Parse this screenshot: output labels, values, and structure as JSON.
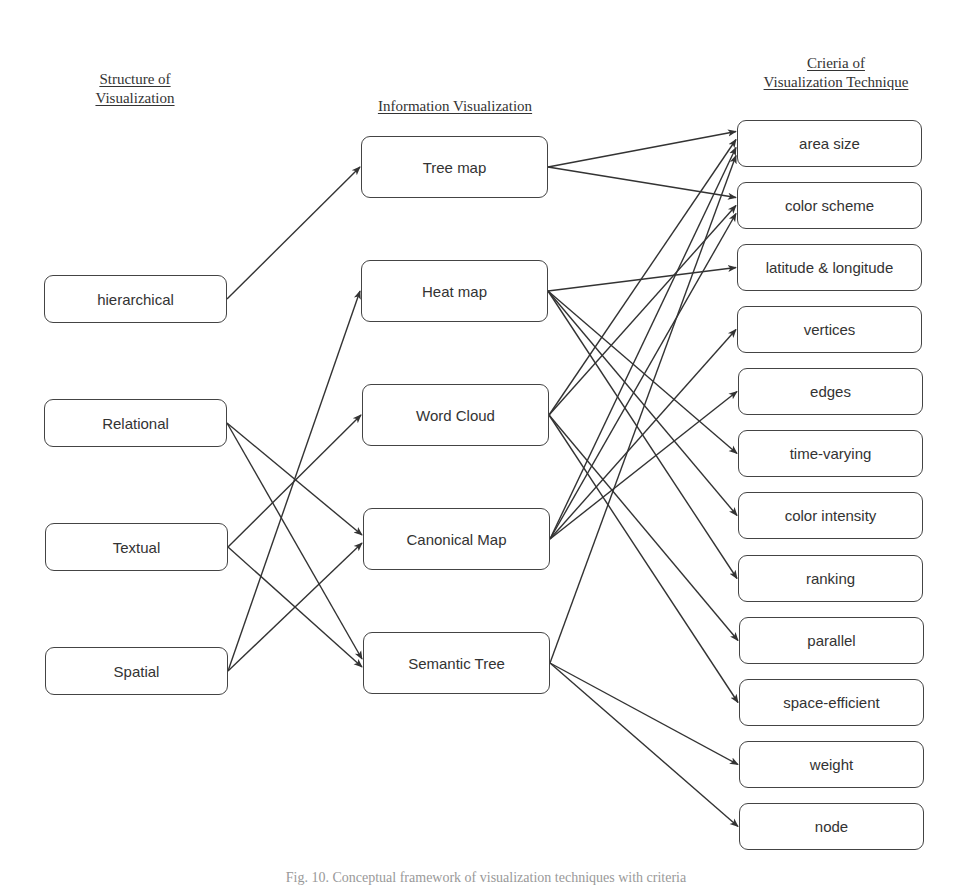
{
  "titles": {
    "structure": "Structure of\nVisualization",
    "info": "Information Visualization",
    "criteria": "Crieria of\nVisualization Technique"
  },
  "structure_nodes": [
    {
      "id": "hierarchical",
      "label": "hierarchical"
    },
    {
      "id": "relational",
      "label": "Relational"
    },
    {
      "id": "textual",
      "label": "Textual"
    },
    {
      "id": "spatial",
      "label": "Spatial"
    }
  ],
  "info_nodes": [
    {
      "id": "treemap",
      "label": "Tree map"
    },
    {
      "id": "heatmap",
      "label": "Heat map"
    },
    {
      "id": "wordcloud",
      "label": "Word Cloud"
    },
    {
      "id": "canonical",
      "label": "Canonical Map"
    },
    {
      "id": "semantic",
      "label": "Semantic Tree"
    }
  ],
  "criteria_nodes": [
    {
      "id": "area",
      "label": "area size"
    },
    {
      "id": "colorscheme",
      "label": "color scheme"
    },
    {
      "id": "latlong",
      "label": "latitude & longitude"
    },
    {
      "id": "vertices",
      "label": "vertices"
    },
    {
      "id": "edges",
      "label": "edges"
    },
    {
      "id": "timevarying",
      "label": "time-varying"
    },
    {
      "id": "colorintensity",
      "label": "color intensity"
    },
    {
      "id": "ranking",
      "label": "ranking"
    },
    {
      "id": "parallel",
      "label": "parallel"
    },
    {
      "id": "spaceefficient",
      "label": "space-efficient"
    },
    {
      "id": "weight",
      "label": "weight"
    },
    {
      "id": "node",
      "label": "node"
    }
  ],
  "edges": [
    [
      "hierarchical",
      "treemap"
    ],
    [
      "relational",
      "canonical"
    ],
    [
      "relational",
      "semantic"
    ],
    [
      "textual",
      "wordcloud"
    ],
    [
      "textual",
      "semantic"
    ],
    [
      "spatial",
      "heatmap"
    ],
    [
      "spatial",
      "canonical"
    ],
    [
      "treemap",
      "area"
    ],
    [
      "treemap",
      "colorscheme"
    ],
    [
      "heatmap",
      "latlong"
    ],
    [
      "heatmap",
      "timevarying"
    ],
    [
      "heatmap",
      "colorintensity"
    ],
    [
      "heatmap",
      "ranking"
    ],
    [
      "wordcloud",
      "area"
    ],
    [
      "wordcloud",
      "colorscheme"
    ],
    [
      "wordcloud",
      "parallel"
    ],
    [
      "wordcloud",
      "spaceefficient"
    ],
    [
      "canonical",
      "area"
    ],
    [
      "canonical",
      "colorscheme"
    ],
    [
      "canonical",
      "vertices"
    ],
    [
      "canonical",
      "edges"
    ],
    [
      "semantic",
      "area"
    ],
    [
      "semantic",
      "weight"
    ],
    [
      "semantic",
      "node"
    ]
  ],
  "caption": "Fig. 10. Conceptual framework of visualization techniques with criteria"
}
